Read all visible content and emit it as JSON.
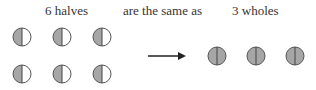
{
  "labels": {
    "left": "6 halves",
    "middle": "are the same as",
    "right": "3 wholes"
  },
  "left_group": {
    "count": 6,
    "shape": "half-shaded-circle",
    "fill": "#a6a6a6"
  },
  "right_group": {
    "count": 3,
    "shape": "fully-shaded-circle",
    "fill": "#a6a6a6"
  },
  "arrow": {
    "direction": "right",
    "color": "#222222"
  }
}
